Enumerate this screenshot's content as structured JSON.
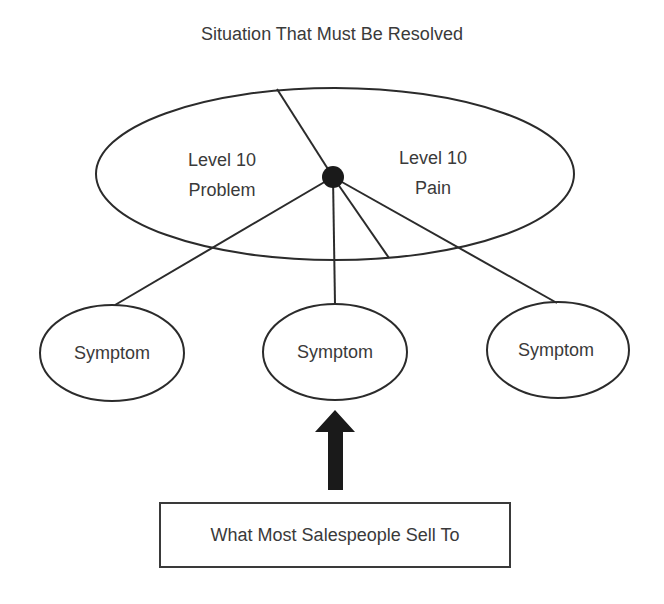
{
  "diagram": {
    "title": "Situation That Must Be Resolved",
    "main_ellipse": {
      "left_label_line1": "Level 10",
      "left_label_line2": "Problem",
      "right_label_line1": "Level 10",
      "right_label_line2": "Pain"
    },
    "symptoms": [
      {
        "label": "Symptom"
      },
      {
        "label": "Symptom"
      },
      {
        "label": "Symptom"
      }
    ],
    "callout_box": "What Most Salespeople Sell To",
    "colors": {
      "stroke": "#2b2b2b",
      "text": "#3a3a3a",
      "background": "#ffffff"
    }
  }
}
